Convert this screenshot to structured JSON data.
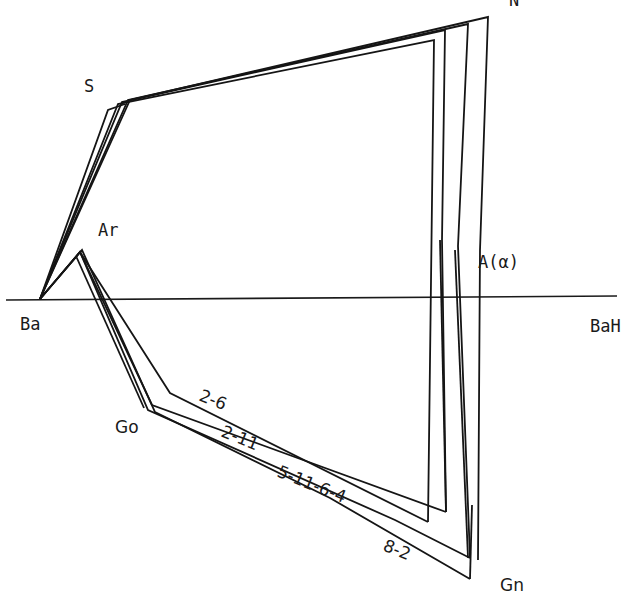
{
  "labels": {
    "N": "N",
    "S": "S",
    "Ar": "Ar",
    "Ba": "Ba",
    "BaH": "BaH",
    "A": "A(α)",
    "Go": "Go",
    "Gn": "Gn"
  },
  "tracings": [
    {
      "id": "2-6",
      "label": "2-6"
    },
    {
      "id": "2-11",
      "label": "2-11"
    },
    {
      "id": "5-11-6-4",
      "label": "5-11-6-4"
    },
    {
      "id": "8-2",
      "label": "8-2"
    }
  ],
  "reference_line": {
    "from": "Ba",
    "to": "BaH"
  }
}
